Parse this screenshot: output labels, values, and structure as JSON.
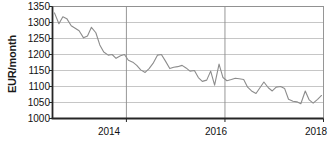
{
  "chart_data": {
    "type": "line",
    "title": "",
    "subtitle": "",
    "xlabel": "",
    "ylabel": "EUR/month",
    "ylim": [
      1000,
      1350
    ],
    "xlim": [
      2012.5,
      2018.0
    ],
    "ytick_labels": [
      "1350",
      "1300",
      "1250",
      "1200",
      "1150",
      "1100",
      "1050",
      "1000"
    ],
    "ytick_values": [
      1350,
      1300,
      1250,
      1200,
      1150,
      1100,
      1050,
      1000
    ],
    "xtick_labels": [
      "2014",
      "2016",
      "2018"
    ],
    "xtick_values": [
      2014,
      2016,
      2018
    ],
    "grid": "horizontal-and-vertical",
    "legend": "none",
    "series": [
      {
        "name": "EUR/month",
        "color": "#8c8c8c",
        "x": [
          2012.54,
          2012.63,
          2012.71,
          2012.79,
          2012.88,
          2012.96,
          2013.04,
          2013.13,
          2013.21,
          2013.29,
          2013.38,
          2013.46,
          2013.54,
          2013.63,
          2013.71,
          2013.79,
          2013.88,
          2013.96,
          2014.04,
          2014.13,
          2014.21,
          2014.29,
          2014.38,
          2014.46,
          2014.54,
          2014.63,
          2014.71,
          2014.79,
          2014.88,
          2014.96,
          2015.04,
          2015.13,
          2015.21,
          2015.29,
          2015.38,
          2015.46,
          2015.54,
          2015.63,
          2015.71,
          2015.79,
          2015.88,
          2015.96,
          2016.04,
          2016.13,
          2016.21,
          2016.29,
          2016.38,
          2016.46,
          2016.54,
          2016.63,
          2016.71,
          2016.79,
          2016.88,
          2016.96,
          2017.04,
          2017.13,
          2017.21,
          2017.29,
          2017.38,
          2017.46,
          2017.54,
          2017.63,
          2017.71,
          2017.79,
          2017.88,
          2017.96
        ],
        "y": [
          1330,
          1296,
          1318,
          1312,
          1290,
          1282,
          1274,
          1252,
          1258,
          1285,
          1268,
          1230,
          1208,
          1198,
          1200,
          1188,
          1196,
          1200,
          1182,
          1176,
          1166,
          1152,
          1144,
          1156,
          1172,
          1198,
          1200,
          1180,
          1156,
          1160,
          1162,
          1166,
          1158,
          1148,
          1150,
          1128,
          1116,
          1120,
          1148,
          1104,
          1170,
          1128,
          1118,
          1122,
          1126,
          1124,
          1122,
          1098,
          1086,
          1078,
          1096,
          1114,
          1096,
          1086,
          1098,
          1100,
          1094,
          1060,
          1054,
          1052,
          1046,
          1086,
          1058,
          1048,
          1060,
          1072
        ]
      }
    ]
  },
  "axis_label": {
    "y": "EUR/month"
  }
}
